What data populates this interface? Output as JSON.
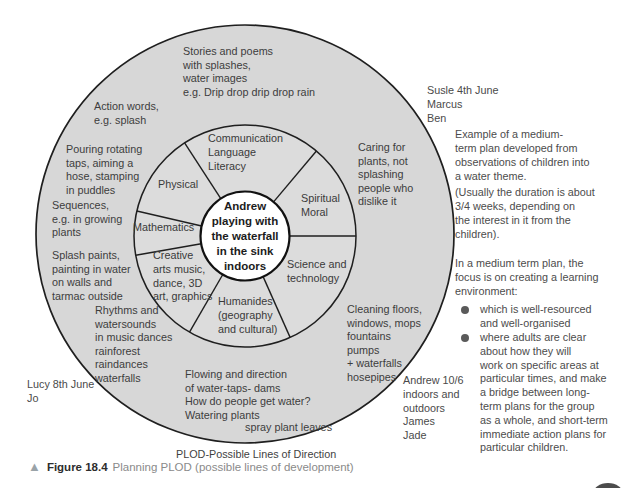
{
  "colors": {
    "circle_fill": "#d7d7d7",
    "ring_fill": "#dcdcdc",
    "hub_fill": "#ffffff",
    "stroke": "#1f1f1f",
    "page_badge": "#4c4c4c"
  },
  "hub": {
    "label": "Andrew\nplaying with\nthe waterfall\nin the sink\nindoors"
  },
  "segments": [
    {
      "id": "communication",
      "label": "Communication\nLanguage\nLiteracy"
    },
    {
      "id": "spiritual-moral",
      "label": "Spiritual\nMoral"
    },
    {
      "id": "science-technology",
      "label": "Science and\ntechnology"
    },
    {
      "id": "humanities",
      "label": "Humanides\n(geography\nand cultural)"
    },
    {
      "id": "creative-arts",
      "label": "Creative\narts music,\ndance, 3D\nart, graphics"
    },
    {
      "id": "mathematics",
      "label": "Mathematics"
    },
    {
      "id": "physical",
      "label": "Physical"
    }
  ],
  "outer_notes": [
    {
      "id": "stories",
      "text": "Stories and poems\nwith splashes,\nwater images\ne.g. Drip drop drip drop rain"
    },
    {
      "id": "action-words",
      "text": "Action words,\ne.g. splash"
    },
    {
      "id": "pouring",
      "text": "Pouring rotating\ntaps, aiming a\nhose, stamping\nin puddles"
    },
    {
      "id": "sequences",
      "text": "Sequences,\ne.g. in growing\nplants"
    },
    {
      "id": "splash-paints",
      "text": "Splash paints,\npainting in water\non walls and\ntarmac outside"
    },
    {
      "id": "rhythms",
      "text": "Rhythms and\nwatersounds\nin music dances\nrainforest\nraindances\nwaterfalls"
    },
    {
      "id": "flowing",
      "text": "Flowing and direction\nof water-taps- dams\nHow do people get water?\nWatering plants"
    },
    {
      "id": "spray",
      "text": "spray plant leaves"
    },
    {
      "id": "cleaning",
      "text": "Cleaning floors,\nwindows, mops\nfountains\npumps\n+ waterfalls\nhosepipes"
    },
    {
      "id": "caring",
      "text": "Caring for\nplants, not\nsplashing\npeople who\ndislike it"
    }
  ],
  "margin_notes": [
    {
      "id": "susie",
      "text": "Susle 4th June\nMarcus\nBen"
    },
    {
      "id": "lucy",
      "text": "Lucy 8th June\nJo"
    },
    {
      "id": "andrew",
      "text": "Andrew 10/6\nindoors and\noutdoors\nJames\nJade"
    }
  ],
  "side_text": {
    "paragraphs": [
      "Example of a medium-\nterm plan developed from\nobservations of children into\na water theme.",
      "(Usually the duration is about\n3/4 weeks, depending on\nthe interest in it from the\nchildren).",
      "In a medium term plan, the\nfocus is on creating a learning\nenvironment:"
    ],
    "bullets": [
      "which is well-resourced\nand well-organised",
      "where adults are clear\nabout how they will\nwork on specific areas at\nparticular times, and make\na bridge between long-\nterm plans for the group\nas a whole, and short-term\nimmediate action plans for\nparticular children."
    ]
  },
  "plod_label": "PLOD-Possible Lines of Direction",
  "caption": {
    "marker": "▲",
    "figure_label": "Figure 18.4",
    "text": "Planning PLOD (possible lines of development)"
  }
}
